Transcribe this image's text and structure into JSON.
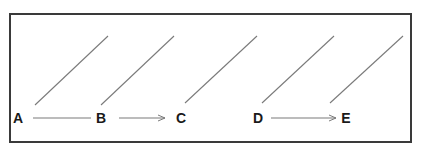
{
  "diagram": {
    "nodes": [
      {
        "id": "A",
        "label": "A",
        "x": 18,
        "y": 118
      },
      {
        "id": "B",
        "label": "B",
        "x": 101,
        "y": 118
      },
      {
        "id": "C",
        "label": "C",
        "x": 181,
        "y": 118
      },
      {
        "id": "D",
        "label": "D",
        "x": 258,
        "y": 118
      },
      {
        "id": "E",
        "label": "E",
        "x": 346,
        "y": 118
      }
    ],
    "edges": [
      {
        "from": "A",
        "to": "B",
        "arrowhead": false
      },
      {
        "from": "B",
        "to": "C",
        "arrowhead": true
      },
      {
        "from": "D",
        "to": "E",
        "arrowhead": true
      }
    ],
    "diagonal_lines": 5,
    "colors": {
      "border": "#3a3a3a",
      "line": "#7a7a7a",
      "text": "#1a1a1a"
    }
  }
}
